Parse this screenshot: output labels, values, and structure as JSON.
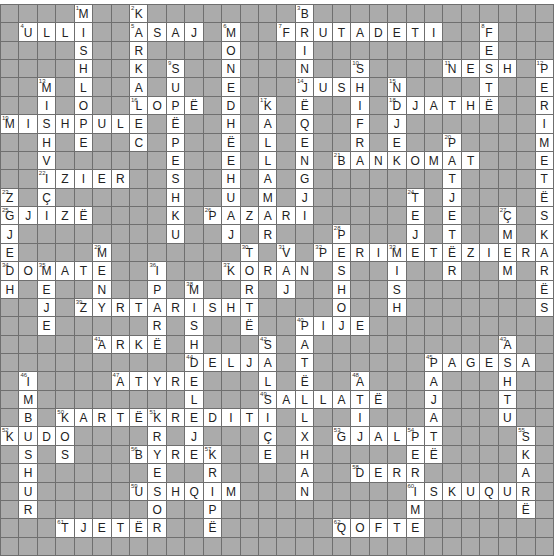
{
  "puzzle": {
    "rows": 30,
    "cols": 30,
    "colors": {
      "block": "#ababab",
      "open": "#ffffff",
      "line": "#6f6f6f",
      "text": "#222222"
    },
    "entries": [
      {
        "n": 1,
        "r": 0,
        "c": 4,
        "dir": "down",
        "word": "MISHLOPE"
      },
      {
        "n": 2,
        "r": 0,
        "c": 7,
        "dir": "down",
        "word": "KARKALEC"
      },
      {
        "n": 3,
        "r": 0,
        "c": 16,
        "dir": "down",
        "word": "BRINJËQENGJI"
      },
      {
        "n": 4,
        "r": 1,
        "c": 1,
        "dir": "across",
        "word": "ULLI"
      },
      {
        "n": 5,
        "r": 1,
        "c": 7,
        "dir": "across",
        "word": "ASAJ"
      },
      {
        "n": 6,
        "r": 1,
        "c": 12,
        "dir": "down",
        "word": "MONEDHËEHUAJ"
      },
      {
        "n": 7,
        "r": 1,
        "c": 15,
        "dir": "across",
        "word": "FRUTADETI"
      },
      {
        "n": 8,
        "r": 1,
        "c": 26,
        "dir": "down",
        "word": "FESTË"
      },
      {
        "n": 9,
        "r": 3,
        "c": 9,
        "dir": "down",
        "word": "SUPËPESHKU"
      },
      {
        "n": 10,
        "r": 3,
        "c": 19,
        "dir": "down",
        "word": "SHIFRA"
      },
      {
        "n": 11,
        "r": 3,
        "c": 24,
        "dir": "across",
        "word": "NESH"
      },
      {
        "n": 12,
        "r": 3,
        "c": 29,
        "dir": "down",
        "word": "PERIMETËSKARËS"
      },
      {
        "n": 13,
        "r": 4,
        "c": 2,
        "dir": "down",
        "word": "MISHVIÇI"
      },
      {
        "n": 14,
        "r": 4,
        "c": 16,
        "dir": "across",
        "word": "JUSH"
      },
      {
        "n": 15,
        "r": 4,
        "c": 21,
        "dir": "down",
        "word": "NDJEK"
      },
      {
        "n": 16,
        "r": 5,
        "c": 7,
        "dir": "across",
        "word": "LOPË"
      },
      {
        "n": 17,
        "r": 5,
        "c": 14,
        "dir": "down",
        "word": "KALLAMAR"
      },
      {
        "n": 18,
        "r": 5,
        "c": 21,
        "dir": "across",
        "word": "DJATHË"
      },
      {
        "n": 19,
        "r": 6,
        "c": 0,
        "dir": "across",
        "word": "MISHPULE"
      },
      {
        "n": 20,
        "r": 7,
        "c": 24,
        "dir": "down",
        "word": "PATJETËR"
      },
      {
        "n": 21,
        "r": 8,
        "c": 18,
        "dir": "across",
        "word": "BANKOMAT"
      },
      {
        "n": 22,
        "r": 9,
        "c": 2,
        "dir": "across",
        "word": "IZIER"
      },
      {
        "n": 23,
        "r": 10,
        "c": 0,
        "dir": "down",
        "word": "ZGJEDH"
      },
      {
        "n": 24,
        "r": 10,
        "c": 22,
        "dir": "down",
        "word": "TEJE"
      },
      {
        "n": 25,
        "r": 11,
        "c": 0,
        "dir": "across",
        "word": "GJIZË"
      },
      {
        "n": 26,
        "r": 11,
        "c": 11,
        "dir": "across",
        "word": "PAZARI"
      },
      {
        "n": 27,
        "r": 11,
        "c": 27,
        "dir": "down",
        "word": "ÇMIM"
      },
      {
        "n": 28,
        "r": 12,
        "c": 18,
        "dir": "down",
        "word": "PESHOJ"
      },
      {
        "n": 29,
        "r": 13,
        "c": 5,
        "dir": "down",
        "word": "MENY"
      },
      {
        "n": 30,
        "r": 13,
        "c": 13,
        "dir": "down",
        "word": "TORTË"
      },
      {
        "n": 31,
        "r": 13,
        "c": 15,
        "dir": "down",
        "word": "VAJ"
      },
      {
        "n": 32,
        "r": 13,
        "c": 17,
        "dir": "across",
        "word": "PERIMETËZIERA"
      },
      {
        "n": 33,
        "r": 13,
        "c": 21,
        "dir": "down",
        "word": "MISH"
      },
      {
        "n": 34,
        "r": 14,
        "c": 0,
        "dir": "across",
        "word": "DOMATE"
      },
      {
        "n": 35,
        "r": 14,
        "c": 2,
        "dir": "down",
        "word": "MEJE"
      },
      {
        "n": 36,
        "r": 14,
        "c": 8,
        "dir": "down",
        "word": "IPARË"
      },
      {
        "n": 37,
        "r": 14,
        "c": 12,
        "dir": "across",
        "word": "KORAN"
      },
      {
        "n": 38,
        "r": 15,
        "c": 10,
        "dir": "down",
        "word": "MISHDELEJE"
      },
      {
        "n": 39,
        "r": 16,
        "c": 4,
        "dir": "across",
        "word": "ZYRTARISHT"
      },
      {
        "n": 40,
        "r": 17,
        "c": 16,
        "dir": "across",
        "word": "PIJE"
      },
      {
        "n": 41,
        "r": 18,
        "c": 5,
        "dir": "across",
        "word": "ARKË"
      },
      {
        "n": 42,
        "r": 18,
        "c": 14,
        "dir": "down",
        "word": "SALSIÇE"
      },
      {
        "n": 43,
        "r": 18,
        "c": 27,
        "dir": "down",
        "word": "ASHTU"
      },
      {
        "n": 44,
        "r": 19,
        "c": 10,
        "dir": "across",
        "word": "DELJA"
      },
      {
        "n": 45,
        "r": 19,
        "c": 23,
        "dir": "across",
        "word": "PAGESA"
      },
      {
        "n": 46,
        "r": 20,
        "c": 1,
        "dir": "down",
        "word": "IMBUSHUR"
      },
      {
        "n": 47,
        "r": 20,
        "c": 6,
        "dir": "across",
        "word": "ATYRE"
      },
      {
        "n": 48,
        "r": 20,
        "c": 19,
        "dir": "down",
        "word": "ATIJ"
      },
      {
        "n": 49,
        "r": 21,
        "c": 14,
        "dir": "across",
        "word": "SALLATË"
      },
      {
        "n": 50,
        "r": 22,
        "c": 3,
        "dir": "across",
        "word": "KARTËKREDITI"
      },
      {
        "n": 51,
        "r": 22,
        "c": 8,
        "dir": "down",
        "word": "KRYESOR"
      },
      {
        "n": 52,
        "r": 23,
        "c": 0,
        "dir": "across",
        "word": "KUDO"
      },
      {
        "n": 53,
        "r": 23,
        "c": 18,
        "dir": "across",
        "word": "GJALPË"
      },
      {
        "n": 54,
        "r": 23,
        "c": 22,
        "dir": "down",
        "word": "PERIME"
      },
      {
        "n": 55,
        "r": 23,
        "c": 28,
        "dir": "down",
        "word": "SKARË"
      },
      {
        "n": 56,
        "r": 24,
        "c": 7,
        "dir": "across",
        "word": "BYREK"
      },
      {
        "n": 57,
        "r": 24,
        "c": 11,
        "dir": "down",
        "word": "KRIPË"
      },
      {
        "n": 58,
        "r": 25,
        "c": 19,
        "dir": "across",
        "word": "DERR"
      },
      {
        "n": 59,
        "r": 26,
        "c": 7,
        "dir": "across",
        "word": "USHQIM"
      },
      {
        "n": 60,
        "r": 26,
        "c": 22,
        "dir": "across",
        "word": "ISKUQUR"
      },
      {
        "n": 61,
        "r": 28,
        "c": 3,
        "dir": "across",
        "word": "TJETËR"
      },
      {
        "n": 62,
        "r": 28,
        "c": 18,
        "dir": "across",
        "word": "QOFTE"
      }
    ],
    "extra_entries": [
      {
        "r": 5,
        "c": 16,
        "dir": "down",
        "word": "PATËLLXHAN",
        "start_row": 17
      },
      {
        "r": 19,
        "c": 23,
        "dir": "down",
        "word": "PAJATË"
      },
      {
        "r": 22,
        "c": 3,
        "dir": "down",
        "word": "KOS"
      }
    ]
  }
}
